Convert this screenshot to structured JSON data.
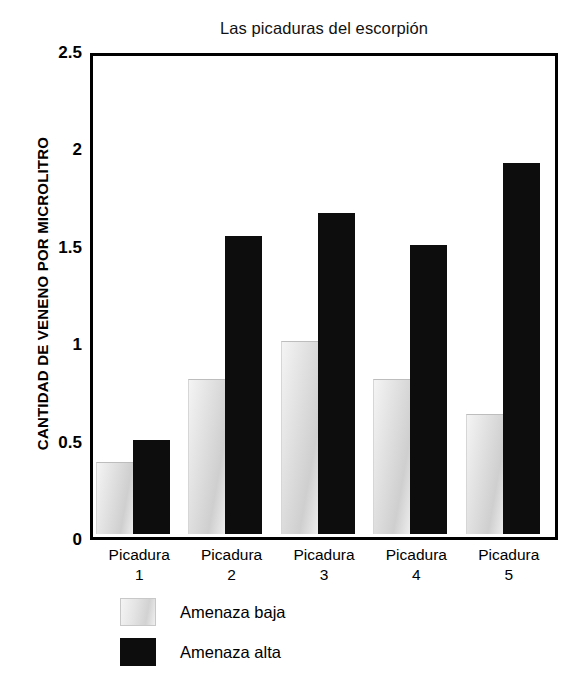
{
  "chart_data": {
    "type": "bar",
    "title": "Las picaduras del escorpión",
    "xlabel": "",
    "ylabel": "CANTIDAD DE VENENO POR MICROLITRO",
    "categories": [
      "Picadura 1",
      "Picadura 2",
      "Picadura 3",
      "Picadura 4",
      "Picadura 5"
    ],
    "category_lines": [
      {
        "name": "Picadura",
        "index": "1"
      },
      {
        "name": "Picadura",
        "index": "2"
      },
      {
        "name": "Picadura",
        "index": "3"
      },
      {
        "name": "Picadura",
        "index": "4"
      },
      {
        "name": "Picadura",
        "index": "5"
      }
    ],
    "series": [
      {
        "name": "Amenaza baja",
        "color": "#e0e0e0",
        "values": [
          0.37,
          0.8,
          1.0,
          0.8,
          0.62
        ]
      },
      {
        "name": "Amenaza alta",
        "color": "#0d0d0d",
        "values": [
          0.49,
          1.55,
          1.67,
          1.5,
          1.93
        ]
      }
    ],
    "ylim": [
      0,
      2.5
    ],
    "yticks": [
      "0",
      "0.5",
      "1",
      "1.5",
      "2",
      "2.5"
    ],
    "ytick_values": [
      0,
      0.5,
      1,
      1.5,
      2,
      2.5
    ],
    "grid": false,
    "legend_position": "bottom-left",
    "legend": [
      {
        "label": "Amenaza baja",
        "swatch": "low"
      },
      {
        "label": "Amenaza alta",
        "swatch": "high"
      }
    ]
  }
}
